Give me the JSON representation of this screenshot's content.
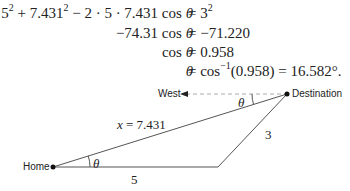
{
  "equations": [
    {
      "lhs": "5² + 7.431² − 2 · 5 · 7.431 cos θ",
      "rhs": "= 3²"
    },
    {
      "lhs": "−74.31 cos θ",
      "rhs": "= −71.220"
    },
    {
      "lhs": "cos θ",
      "rhs": "= 0.958"
    },
    {
      "lhs": "θ",
      "rhs": "= cos⁻¹(0.958) = 16.582°."
    }
  ],
  "diagram": {
    "points": {
      "home": {
        "label": "Home",
        "x": 53,
        "y": 167
      },
      "vertex": {
        "x": 218,
        "y": 167
      },
      "destination": {
        "label": "Destination",
        "x": 287,
        "y": 94
      }
    },
    "west_label": "West",
    "side_labels": {
      "hypotenuse": "x = 7.431",
      "base": "5",
      "right_side": "3"
    },
    "angle_label": "θ",
    "colors": {
      "line": "#555555",
      "dashed": "#aaaaaa",
      "dot": "#111111"
    }
  }
}
